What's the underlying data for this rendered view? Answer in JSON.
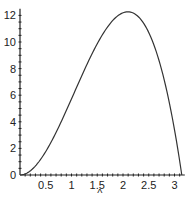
{
  "chart_data": {
    "type": "line",
    "title": "",
    "xlabel": "",
    "ylabel": "",
    "xlim": [
      0,
      3.2
    ],
    "ylim": [
      0,
      12.5
    ],
    "grid": false,
    "legend": null,
    "x_ticks": [
      0.5,
      1,
      1.5,
      2,
      2.5,
      3
    ],
    "x_tick_labels": [
      "0.5",
      "1",
      "1.5",
      "2",
      "2.5",
      "3"
    ],
    "y_ticks": [
      0,
      2,
      4,
      6,
      8,
      10,
      12
    ],
    "y_tick_labels": [
      "0",
      "2",
      "4",
      "6",
      "8",
      "10",
      "12"
    ],
    "annotations": [
      {
        "text": "^",
        "x": 1.55,
        "position": "below x-axis"
      }
    ],
    "series": [
      {
        "name": "curve",
        "color": "#333333",
        "x": [
          0,
          0.25,
          0.5,
          0.75,
          1.0,
          1.25,
          1.5,
          1.75,
          2.0,
          2.1,
          2.25,
          2.5,
          2.75,
          3.0,
          3.14
        ],
        "y": [
          0,
          0.48,
          1.77,
          3.58,
          5.72,
          7.82,
          9.87,
          11.44,
          12.2,
          12.25,
          12.05,
          10.7,
          7.9,
          3.4,
          0
        ]
      }
    ]
  }
}
